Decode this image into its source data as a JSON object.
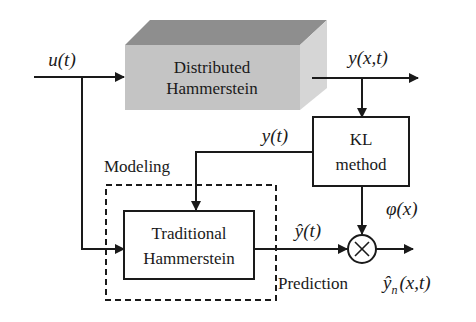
{
  "diagram": {
    "blocks": {
      "distributed": {
        "line1": "Distributed",
        "line2": "Hammerstein"
      },
      "kl": {
        "line1": "KL",
        "line2": "method"
      },
      "traditional": {
        "line1": "Traditional",
        "line2": "Hammerstein"
      }
    },
    "signals": {
      "input": "u(t)",
      "output": "y(x,t)",
      "temporal": "y(t)",
      "basis": "φ(x)",
      "temporal_hat": "ŷ(t)",
      "prediction_out": "ŷ",
      "prediction_sub": "n",
      "prediction_args": "(x,t)"
    },
    "labels": {
      "modeling": "Modeling",
      "prediction": "Prediction"
    },
    "multiplier_symbol": "×",
    "colors": {
      "line": "#1a1a1a",
      "box_front": "#c4c4c4",
      "box_top": "#8e8e8e",
      "box_side": "#d6d6d6"
    }
  }
}
